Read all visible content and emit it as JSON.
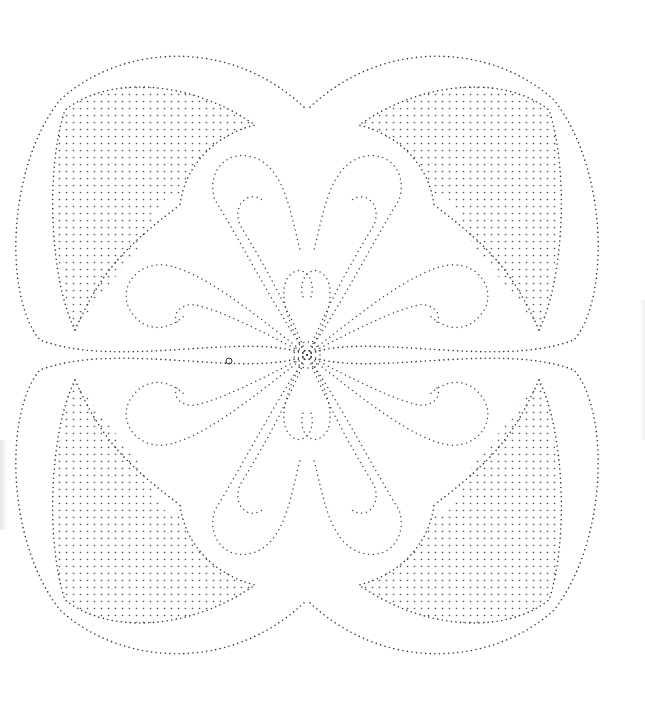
{
  "image": {
    "title": "",
    "description": "Dotted-line quilting pattern with four-fold symmetric scroll and petal design; stippled (grid-dot) fill in four crescent areas",
    "colors": {
      "background": "#ffffff",
      "dots": "#333333"
    },
    "symmetry": "4-fold rotational",
    "center": [
      307,
      355
    ]
  }
}
